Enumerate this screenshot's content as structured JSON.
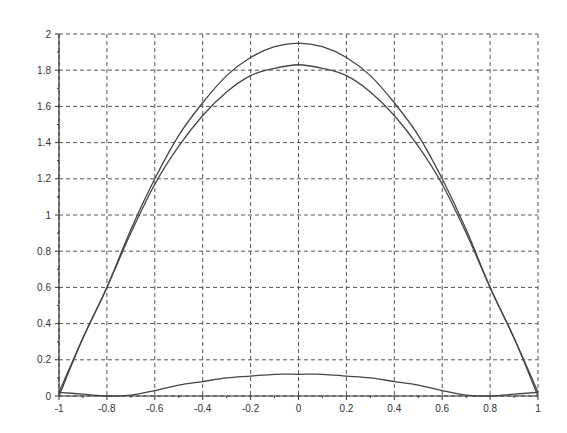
{
  "chart_data": {
    "type": "line",
    "title": "",
    "xlabel": "",
    "ylabel": "",
    "xlim": [
      -1,
      1
    ],
    "ylim": [
      0,
      2
    ],
    "grid": true,
    "legend": null,
    "x_ticks": [
      "-1",
      "-0.8",
      "-0.6",
      "-0.4",
      "-0.2",
      "0",
      "0.2",
      "0.4",
      "0.6",
      "0.8",
      "1"
    ],
    "y_ticks": [
      "0",
      "0.2",
      "0.4",
      "0.6",
      "0.8",
      "1",
      "1.2",
      "1.4",
      "1.6",
      "1.8",
      "2"
    ],
    "x": [
      -1,
      -0.9,
      -0.8,
      -0.7,
      -0.6,
      -0.5,
      -0.4,
      -0.3,
      -0.2,
      -0.1,
      0,
      0.1,
      0.2,
      0.3,
      0.4,
      0.5,
      0.6,
      0.7,
      0.8,
      0.9,
      1
    ],
    "series": [
      {
        "name": "curve-1",
        "color": "#444444",
        "values": [
          0.0,
          0.32,
          0.6,
          0.92,
          1.2,
          1.44,
          1.62,
          1.77,
          1.87,
          1.93,
          1.95,
          1.93,
          1.87,
          1.77,
          1.62,
          1.44,
          1.2,
          0.92,
          0.6,
          0.32,
          0.0
        ]
      },
      {
        "name": "curve-2",
        "color": "#444444",
        "values": [
          0.02,
          0.32,
          0.6,
          0.9,
          1.17,
          1.38,
          1.55,
          1.68,
          1.77,
          1.81,
          1.83,
          1.81,
          1.77,
          1.68,
          1.55,
          1.38,
          1.17,
          0.9,
          0.6,
          0.32,
          0.02
        ]
      },
      {
        "name": "curve-3",
        "color": "#444444",
        "values": [
          0.02,
          0.01,
          0.0,
          0.005,
          0.03,
          0.06,
          0.08,
          0.1,
          0.11,
          0.12,
          0.12,
          0.12,
          0.11,
          0.1,
          0.08,
          0.06,
          0.03,
          0.005,
          0.0,
          0.01,
          0.02
        ]
      }
    ]
  },
  "plot_area": {
    "left": 59,
    "right": 538,
    "top": 34,
    "bottom": 396
  }
}
